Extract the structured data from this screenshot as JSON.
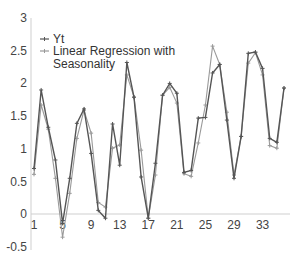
{
  "chart_data": {
    "type": "line",
    "title": "",
    "xlabel": "",
    "ylabel": "",
    "ylim": [
      -0.5,
      3
    ],
    "yticks": [
      "3",
      "2.5",
      "2",
      "1.5",
      "1",
      "0.5",
      "0",
      "-0.5"
    ],
    "ytick_values": [
      3,
      2.5,
      2,
      1.5,
      1,
      0.5,
      0,
      -0.5
    ],
    "xticks": [
      "1",
      "5",
      "9",
      "13",
      "17",
      "21",
      "25",
      "29",
      "33"
    ],
    "xtick_values": [
      1,
      5,
      9,
      13,
      17,
      21,
      25,
      29,
      33
    ],
    "xlim": [
      1,
      36
    ],
    "grid": false,
    "legend_position": "top-left",
    "x": [
      1,
      2,
      3,
      4,
      5,
      6,
      7,
      8,
      9,
      10,
      11,
      12,
      13,
      14,
      15,
      16,
      17,
      18,
      19,
      20,
      21,
      22,
      23,
      24,
      25,
      26,
      27,
      28,
      29,
      30,
      31,
      32,
      33,
      34,
      35,
      36
    ],
    "series": [
      {
        "name": "Yt",
        "color": "#555555",
        "values": [
          0.7,
          1.9,
          1.33,
          0.83,
          -0.14,
          0.55,
          1.39,
          1.61,
          0.93,
          0.06,
          -0.06,
          1.38,
          0.75,
          2.32,
          1.79,
          0.57,
          -0.06,
          0.78,
          1.82,
          2.0,
          1.85,
          0.64,
          0.67,
          1.47,
          1.48,
          2.16,
          2.29,
          1.44,
          0.55,
          1.19,
          2.46,
          2.48,
          2.23,
          1.16,
          1.1,
          1.93
        ]
      },
      {
        "name": "Linear Regression with Seasonality",
        "color": "#9a9a9a",
        "values": [
          0.61,
          1.67,
          1.3,
          0.55,
          -0.35,
          0.32,
          1.16,
          1.59,
          1.24,
          0.18,
          0.11,
          1.01,
          1.06,
          2.13,
          1.79,
          0.98,
          -0.06,
          0.6,
          1.82,
          1.94,
          1.7,
          0.62,
          0.58,
          1.09,
          1.67,
          2.57,
          2.29,
          1.56,
          0.6,
          1.19,
          2.31,
          2.47,
          2.13,
          1.05,
          1.01,
          1.93
        ]
      }
    ]
  },
  "legend": {
    "items": [
      "Yt",
      "Linear Regression with",
      "Seasonality"
    ]
  }
}
